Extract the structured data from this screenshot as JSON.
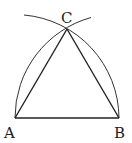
{
  "diagram": {
    "points": {
      "A": {
        "label": "A",
        "x": 15,
        "y": 118
      },
      "B": {
        "label": "B",
        "x": 119,
        "y": 118
      },
      "C": {
        "label": "C",
        "x": 67,
        "y": 29
      }
    },
    "segments": [
      "AB",
      "AC",
      "BC"
    ],
    "arcs": [
      {
        "center": "A",
        "radius": "AB",
        "from": "B",
        "to": "beyond C"
      },
      {
        "center": "B",
        "radius": "BA",
        "from": "A",
        "to": "beyond C"
      }
    ],
    "colors": {
      "stroke": "#222222",
      "background": "#ffffff"
    }
  }
}
